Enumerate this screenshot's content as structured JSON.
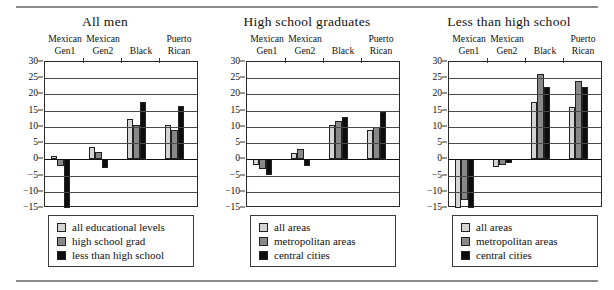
{
  "figure": {
    "background": "#ffffff",
    "rules": {
      "color": "#8b8b8b"
    }
  },
  "chart_data": [
    {
      "type": "bar",
      "title": "All men",
      "xlabel": "",
      "ylabel": "",
      "ylim": [
        -15,
        30
      ],
      "yticks": [
        30,
        25,
        20,
        15,
        10,
        5,
        0,
        -5,
        -10,
        -15
      ],
      "ytick_labels": [
        "30",
        "25",
        "20",
        "15",
        "10",
        "5",
        "0",
        "−5",
        "−10",
        "−15"
      ],
      "grid": true,
      "legend_position": "below",
      "categories": [
        {
          "line1": "Mexican",
          "line2": "Gen1"
        },
        {
          "line1": "Mexican",
          "line2": "Gen2"
        },
        {
          "line1": "",
          "line2": "Black"
        },
        {
          "line1": "Puerto",
          "line2": "Rican"
        }
      ],
      "series": [
        {
          "name": "all educational levels",
          "color": "#d4d4d4",
          "swatch": "sw-all",
          "values": [
            1.0,
            3.7,
            12.3,
            10.6
          ]
        },
        {
          "name": "high school grad",
          "color": "#888888",
          "swatch": "sw-mid",
          "values": [
            -2.1,
            2.4,
            10.7,
            9.0
          ]
        },
        {
          "name": "less than high school",
          "color": "#0d0d0d",
          "swatch": "sw-dark",
          "values": [
            -15.0,
            -2.6,
            17.8,
            16.4
          ]
        }
      ]
    },
    {
      "type": "bar",
      "title": "High school graduates",
      "xlabel": "",
      "ylabel": "",
      "ylim": [
        -15,
        30
      ],
      "yticks": [
        30,
        25,
        20,
        15,
        10,
        5,
        0,
        -5,
        -10,
        -15
      ],
      "ytick_labels": [
        "30",
        "25",
        "20",
        "15",
        "10",
        "5",
        "0",
        "−5",
        "−10",
        "−15"
      ],
      "grid": true,
      "legend_position": "below",
      "categories": [
        {
          "line1": "Mexican",
          "line2": "Gen1"
        },
        {
          "line1": "Mexican",
          "line2": "Gen2"
        },
        {
          "line1": "",
          "line2": "Black"
        },
        {
          "line1": "Puerto",
          "line2": "Rican"
        }
      ],
      "series": [
        {
          "name": "all areas",
          "color": "#d4d4d4",
          "swatch": "sw-all",
          "values": [
            -1.8,
            2.1,
            10.6,
            9.0
          ]
        },
        {
          "name": "metropolitan areas",
          "color": "#888888",
          "swatch": "sw-mid",
          "values": [
            -3.0,
            3.1,
            11.9,
            10.0
          ]
        },
        {
          "name": "central cities",
          "color": "#0d0d0d",
          "swatch": "sw-dark",
          "values": [
            -4.8,
            -2.0,
            13.0,
            14.6
          ]
        }
      ]
    },
    {
      "type": "bar",
      "title": "Less than high school",
      "xlabel": "",
      "ylabel": "",
      "ylim": [
        -15,
        30
      ],
      "yticks": [
        30,
        25,
        20,
        15,
        10,
        5,
        0,
        -5,
        -10,
        -15
      ],
      "ytick_labels": [
        "30",
        "25",
        "20",
        "15",
        "10",
        "5",
        "0",
        "−5",
        "−10",
        "−15"
      ],
      "grid": true,
      "legend_position": "below",
      "categories": [
        {
          "line1": "Mexican",
          "line2": "Gen1"
        },
        {
          "line1": "Mexican",
          "line2": "Gen2"
        },
        {
          "line1": "",
          "line2": "Black"
        },
        {
          "line1": "Puerto",
          "line2": "Rican"
        }
      ],
      "series": [
        {
          "name": "all areas",
          "color": "#d4d4d4",
          "swatch": "sw-all",
          "values": [
            -15.0,
            -2.5,
            17.6,
            16.0
          ]
        },
        {
          "name": "metropolitan areas",
          "color": "#888888",
          "swatch": "sw-mid",
          "values": [
            -12.4,
            -1.8,
            26.4,
            24.1
          ]
        },
        {
          "name": "central cities",
          "color": "#0d0d0d",
          "swatch": "sw-dark",
          "values": [
            -15.0,
            -1.2,
            22.4,
            22.3
          ]
        }
      ]
    }
  ]
}
